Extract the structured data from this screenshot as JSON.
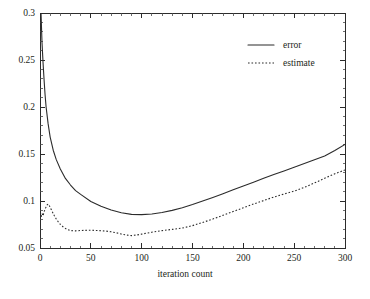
{
  "chart_data": {
    "type": "line",
    "title": "",
    "subtitle": "",
    "xlabel": "iteration count",
    "ylabel": "",
    "xlim": [
      0,
      300
    ],
    "ylim": [
      0.05,
      0.3
    ],
    "grid": false,
    "legend_position": "upper-right",
    "xticks": [
      0,
      50,
      100,
      150,
      200,
      250,
      300
    ],
    "xtick_labels": [
      "0",
      "50",
      "100",
      "150",
      "200",
      "250",
      "300"
    ],
    "yticks": [
      0.05,
      0.1,
      0.15,
      0.2,
      0.25,
      0.3
    ],
    "ytick_labels": [
      "0.05",
      "0.1",
      "0.15",
      "0.2",
      "0.25",
      "0.3"
    ],
    "x_minor_step": 10,
    "y_minor_step": 0.01,
    "series": [
      {
        "name": "error",
        "style": "solid",
        "color": "#2b2b2b",
        "x": [
          0,
          1,
          2,
          3,
          4,
          5,
          6,
          8,
          10,
          13,
          16,
          20,
          25,
          30,
          35,
          40,
          50,
          60,
          70,
          80,
          90,
          100,
          110,
          120,
          130,
          140,
          150,
          160,
          170,
          180,
          190,
          200,
          210,
          220,
          230,
          240,
          250,
          260,
          270,
          280,
          290,
          300
        ],
        "y": [
          0.335,
          0.3,
          0.268,
          0.247,
          0.229,
          0.213,
          0.2,
          0.182,
          0.168,
          0.154,
          0.144,
          0.134,
          0.124,
          0.117,
          0.111,
          0.107,
          0.0995,
          0.0945,
          0.0905,
          0.0875,
          0.0858,
          0.0855,
          0.0862,
          0.0878,
          0.09,
          0.0928,
          0.0962,
          0.1,
          0.1038,
          0.1078,
          0.112,
          0.116,
          0.12,
          0.1242,
          0.1282,
          0.132,
          0.1358,
          0.1398,
          0.1438,
          0.1478,
          0.1538,
          0.1602
        ]
      },
      {
        "name": "estimate",
        "style": "dotted",
        "color": "#2b2b2b",
        "x": [
          0,
          1,
          2,
          3,
          4,
          5,
          6,
          7,
          8,
          9,
          10,
          12,
          14,
          16,
          18,
          20,
          23,
          26,
          30,
          35,
          40,
          45,
          50,
          55,
          60,
          65,
          70,
          75,
          80,
          85,
          90,
          95,
          100,
          110,
          120,
          130,
          140,
          150,
          160,
          170,
          180,
          190,
          200,
          210,
          220,
          230,
          240,
          250,
          260,
          270,
          280,
          290,
          300
        ],
        "y": [
          0.0855,
          0.0826,
          0.0868,
          0.0842,
          0.0886,
          0.0912,
          0.0938,
          0.0958,
          0.0968,
          0.0955,
          0.0932,
          0.0888,
          0.0845,
          0.0808,
          0.0778,
          0.0752,
          0.0722,
          0.0702,
          0.0685,
          0.0682,
          0.0686,
          0.0688,
          0.0689,
          0.0686,
          0.0684,
          0.068,
          0.0672,
          0.0662,
          0.0648,
          0.0638,
          0.0632,
          0.0638,
          0.0648,
          0.0668,
          0.0685,
          0.0698,
          0.0712,
          0.0738,
          0.0772,
          0.0808,
          0.0848,
          0.0888,
          0.0928,
          0.0968,
          0.1005,
          0.1042,
          0.1075,
          0.1105,
          0.1145,
          0.1192,
          0.1242,
          0.129,
          0.133
        ]
      }
    ],
    "legend": [
      {
        "label": "error",
        "style": "solid"
      },
      {
        "label": "estimate",
        "style": "dotted"
      }
    ]
  },
  "axes": {
    "x_axis_name": "iteration count",
    "plot_left": 40,
    "plot_right": 345,
    "plot_top": 13,
    "plot_bottom": 248
  }
}
